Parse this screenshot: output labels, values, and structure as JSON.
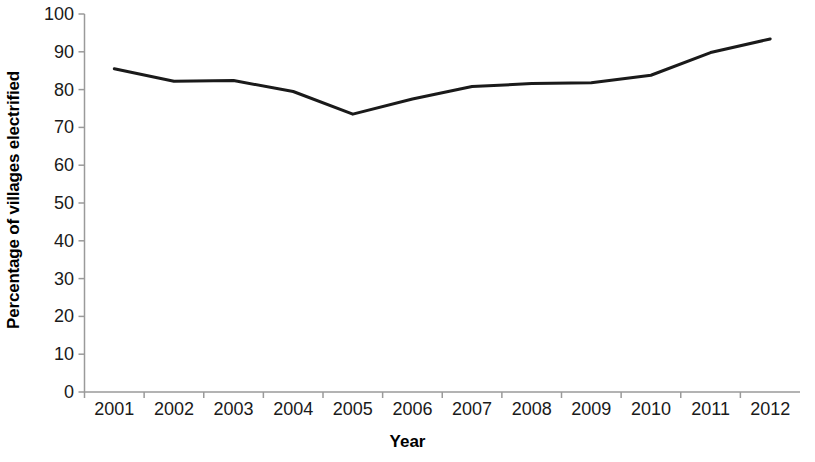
{
  "chart_data": {
    "type": "line",
    "title": "",
    "xlabel": "Year",
    "ylabel": "Percentage of villages electrified",
    "categories": [
      "2001",
      "2002",
      "2003",
      "2004",
      "2005",
      "2006",
      "2007",
      "2008",
      "2009",
      "2010",
      "2011",
      "2012"
    ],
    "values": [
      85.5,
      82.2,
      82.4,
      79.5,
      73.5,
      77.5,
      80.8,
      81.6,
      81.8,
      83.8,
      89.8,
      93.4
    ],
    "series": [
      {
        "name": "Percentage of villages electrified",
        "values": [
          85.5,
          82.2,
          82.4,
          79.5,
          73.5,
          77.5,
          80.8,
          81.6,
          81.8,
          83.8,
          89.8,
          93.4
        ]
      }
    ],
    "ylim": [
      0,
      100
    ],
    "ytick_labels": [
      "0",
      "10",
      "20",
      "30",
      "40",
      "50",
      "60",
      "70",
      "80",
      "90",
      "100"
    ],
    "ytick_values": [
      0,
      10,
      20,
      30,
      40,
      50,
      60,
      70,
      80,
      90,
      100
    ],
    "grid": false,
    "legend": false,
    "legend_position": "none",
    "line_color": "#1a1a1a",
    "line_width": 3,
    "markers": false,
    "axis_color": "#999999",
    "background_color": "#ffffff"
  },
  "axes": {
    "y_title": "Percentage of villages electrified",
    "x_title": "Year"
  }
}
